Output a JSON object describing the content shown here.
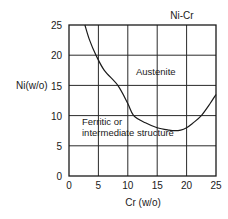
{
  "chart_data": {
    "type": "line",
    "title": "Ni-Cr",
    "xlabel": "Cr (w/o)",
    "ylabel": "Ni(w/o)",
    "xlim": [
      0,
      25
    ],
    "ylim": [
      0,
      25
    ],
    "xticks": [
      "0",
      "5",
      "10",
      "15",
      "20",
      "25"
    ],
    "yticks": [
      "0",
      "5",
      "10",
      "15",
      "20",
      "25"
    ],
    "grid": true,
    "series": [
      {
        "name": "Austenite boundary",
        "x": [
          2.7,
          3.5,
          4.6,
          6,
          8.3,
          10,
          11,
          13,
          15,
          17,
          18,
          19,
          20,
          21,
          22.5,
          24,
          25
        ],
        "y": [
          25,
          22.5,
          20,
          17.5,
          15,
          12,
          10,
          8.8,
          8.0,
          7.6,
          7.5,
          7.6,
          8.0,
          8.7,
          10,
          12,
          13.5
        ]
      }
    ],
    "annotations": [
      {
        "text": "Austenite",
        "x": 14,
        "y": 16.5
      },
      {
        "text": "Ferritic or",
        "x": 1.5,
        "y": 9.5
      },
      {
        "text": "intermediate structure",
        "x": 1.5,
        "y": 7.5
      }
    ]
  },
  "labels": {
    "title": "Ni-Cr",
    "xlabel": "Cr (w/o)",
    "ylabel": "Ni(w/o)",
    "region_austenite": "Austenite",
    "region_ferritic_line1": "Ferritic or",
    "region_ferritic_line2": "intermediate structure",
    "xticks": [
      "0",
      "5",
      "10",
      "15",
      "20",
      "25"
    ],
    "yticks": [
      "0",
      "5",
      "10",
      "15",
      "20",
      "25"
    ]
  }
}
